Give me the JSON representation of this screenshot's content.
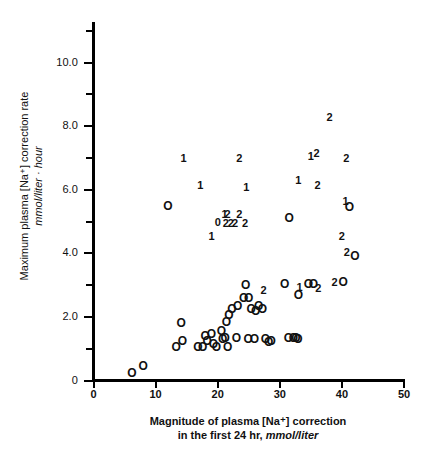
{
  "chart_data": {
    "type": "scatter",
    "title": "",
    "xlabel": "Magnitude of plasma [Na⁺] correction in the first 24 hr, mmol/liter",
    "ylabel": "Maximum plasma [Na⁺] correction rate mmol/liter · hour",
    "xlim": [
      0,
      50
    ],
    "ylim": [
      0,
      11
    ],
    "grid": false,
    "legend": null,
    "xticks": [
      "0",
      "10",
      "20",
      "30",
      "40",
      "50"
    ],
    "xtick_values": [
      0,
      10,
      20,
      30,
      40,
      50
    ],
    "yticks": [
      "0",
      "2.0",
      "4.0",
      "6.0",
      "8.0",
      "10.0"
    ],
    "ytick_values": [
      0,
      2,
      4,
      6,
      8,
      10
    ],
    "yminor_values": [
      1,
      3,
      5,
      7,
      9,
      11
    ],
    "marker_note": "markers drawn as glyphs: 'O' = open circle (1 case), digits '1'/'2'/'0' = overprinted count labels",
    "points": [
      {
        "x": 6.2,
        "y": 0.25,
        "m": "O"
      },
      {
        "x": 8.0,
        "y": 0.45,
        "m": "O"
      },
      {
        "x": 13.3,
        "y": 1.05,
        "m": "O"
      },
      {
        "x": 14.3,
        "y": 1.25,
        "m": "O"
      },
      {
        "x": 14.1,
        "y": 1.8,
        "m": "O"
      },
      {
        "x": 16.8,
        "y": 1.05,
        "m": "O"
      },
      {
        "x": 17.6,
        "y": 1.05,
        "m": "O"
      },
      {
        "x": 18.0,
        "y": 1.4,
        "m": "O"
      },
      {
        "x": 18.3,
        "y": 1.25,
        "m": "O"
      },
      {
        "x": 19.0,
        "y": 1.45,
        "m": "O"
      },
      {
        "x": 19.3,
        "y": 1.15,
        "m": "O"
      },
      {
        "x": 19.8,
        "y": 1.05,
        "m": "O"
      },
      {
        "x": 20.6,
        "y": 1.55,
        "m": "O"
      },
      {
        "x": 20.8,
        "y": 1.3,
        "m": "O"
      },
      {
        "x": 21.2,
        "y": 1.35,
        "m": "O"
      },
      {
        "x": 21.4,
        "y": 1.85,
        "m": "O"
      },
      {
        "x": 21.8,
        "y": 2.05,
        "m": "O"
      },
      {
        "x": 21.6,
        "y": 1.05,
        "m": "O"
      },
      {
        "x": 22.3,
        "y": 2.25,
        "m": "O"
      },
      {
        "x": 23.2,
        "y": 2.35,
        "m": "O"
      },
      {
        "x": 23.0,
        "y": 1.35,
        "m": "O"
      },
      {
        "x": 24.2,
        "y": 2.6,
        "m": "O"
      },
      {
        "x": 24.5,
        "y": 3.0,
        "m": "O"
      },
      {
        "x": 25.0,
        "y": 2.6,
        "m": "O"
      },
      {
        "x": 24.9,
        "y": 1.3,
        "m": "O"
      },
      {
        "x": 25.4,
        "y": 2.25,
        "m": "O"
      },
      {
        "x": 25.9,
        "y": 1.3,
        "m": "O"
      },
      {
        "x": 26.1,
        "y": 2.2,
        "m": "O"
      },
      {
        "x": 26.6,
        "y": 2.35,
        "m": "O"
      },
      {
        "x": 27.2,
        "y": 2.25,
        "m": "O"
      },
      {
        "x": 27.4,
        "y": 2.85,
        "m": "2"
      },
      {
        "x": 27.7,
        "y": 1.3,
        "m": "O"
      },
      {
        "x": 28.2,
        "y": 1.2,
        "m": "O"
      },
      {
        "x": 28.6,
        "y": 1.25,
        "m": "O"
      },
      {
        "x": 30.8,
        "y": 3.05,
        "m": "O"
      },
      {
        "x": 31.4,
        "y": 1.35,
        "m": "O"
      },
      {
        "x": 32.2,
        "y": 1.35,
        "m": "O"
      },
      {
        "x": 32.6,
        "y": 1.35,
        "m": "O"
      },
      {
        "x": 32.9,
        "y": 1.3,
        "m": "O"
      },
      {
        "x": 33.0,
        "y": 2.7,
        "m": "O"
      },
      {
        "x": 33.2,
        "y": 2.95,
        "m": "1"
      },
      {
        "x": 34.6,
        "y": 3.05,
        "m": "O"
      },
      {
        "x": 35.4,
        "y": 3.05,
        "m": "O"
      },
      {
        "x": 36.2,
        "y": 2.9,
        "m": "2"
      },
      {
        "x": 12.0,
        "y": 5.5,
        "m": "O"
      },
      {
        "x": 14.5,
        "y": 7.0,
        "m": "1"
      },
      {
        "x": 17.2,
        "y": 6.15,
        "m": "1"
      },
      {
        "x": 19.0,
        "y": 4.55,
        "m": "1"
      },
      {
        "x": 20.0,
        "y": 5.0,
        "m": "0"
      },
      {
        "x": 21.1,
        "y": 5.25,
        "m": "1"
      },
      {
        "x": 21.6,
        "y": 5.25,
        "m": "2"
      },
      {
        "x": 21.3,
        "y": 4.95,
        "m": "2"
      },
      {
        "x": 22.1,
        "y": 4.95,
        "m": "2"
      },
      {
        "x": 22.8,
        "y": 4.95,
        "m": "2"
      },
      {
        "x": 23.5,
        "y": 5.25,
        "m": "2"
      },
      {
        "x": 24.4,
        "y": 4.95,
        "m": "2"
      },
      {
        "x": 23.5,
        "y": 7.0,
        "m": "2"
      },
      {
        "x": 24.6,
        "y": 6.1,
        "m": "1"
      },
      {
        "x": 31.5,
        "y": 5.1,
        "m": "O"
      },
      {
        "x": 33.0,
        "y": 6.3,
        "m": "1"
      },
      {
        "x": 35.0,
        "y": 7.05,
        "m": "1"
      },
      {
        "x": 35.9,
        "y": 7.15,
        "m": "2"
      },
      {
        "x": 38.0,
        "y": 8.3,
        "m": "2"
      },
      {
        "x": 36.1,
        "y": 6.15,
        "m": "2"
      },
      {
        "x": 40.7,
        "y": 7.0,
        "m": "2"
      },
      {
        "x": 40.6,
        "y": 5.65,
        "m": "1"
      },
      {
        "x": 41.2,
        "y": 5.45,
        "m": "O"
      },
      {
        "x": 40.0,
        "y": 4.55,
        "m": "2"
      },
      {
        "x": 40.8,
        "y": 4.05,
        "m": "2"
      },
      {
        "x": 42.1,
        "y": 3.9,
        "m": "O"
      },
      {
        "x": 38.8,
        "y": 3.1,
        "m": "2"
      },
      {
        "x": 40.2,
        "y": 3.1,
        "m": "O"
      }
    ]
  },
  "axes": {
    "y_title_main": "Maximum plasma [Na⁺] correction rate",
    "y_title_unit": "mmol/liter · hour",
    "x_title_main": "Magnitude of plasma [Na⁺] correction",
    "x_title_line2_prefix": "in the first 24 hr, ",
    "x_title_unit": "mmol/liter"
  },
  "style": {
    "axis_color": "#000000",
    "marker_color": "#111111",
    "background": "#ffffff"
  }
}
